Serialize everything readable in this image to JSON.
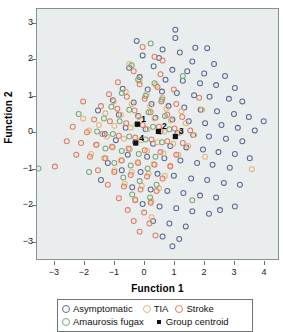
{
  "chart_data": {
    "type": "scatter",
    "title": "",
    "xlabel": "Function 1",
    "ylabel": "Function 2",
    "xlim": [
      -3.6,
      4.5
    ],
    "ylim": [
      -3.5,
      3.4
    ],
    "xticks": [
      -3,
      -2,
      -1,
      0,
      1,
      2,
      3,
      4
    ],
    "yticks": [
      -3,
      -2,
      -1,
      0,
      1,
      2,
      3
    ],
    "grid": false,
    "legend_position": "bottom",
    "marker": "open-circle",
    "series": [
      {
        "name": "Asymptomatic",
        "color": "#5a6b94",
        "points": [
          [
            1.05,
            2.83
          ],
          [
            1.05,
            2.6
          ],
          [
            1.72,
            2.33
          ],
          [
            2.12,
            2.32
          ],
          [
            0.62,
            2.28
          ],
          [
            1.2,
            2.2
          ],
          [
            -0.05,
            2.12
          ],
          [
            0.5,
            2.05
          ],
          [
            1.62,
            1.95
          ],
          [
            2.35,
            1.88
          ],
          [
            0.32,
            1.82
          ],
          [
            -0.5,
            1.78
          ],
          [
            0.95,
            1.72
          ],
          [
            1.45,
            1.68
          ],
          [
            2.02,
            1.62
          ],
          [
            2.72,
            1.55
          ],
          [
            -0.15,
            1.52
          ],
          [
            0.72,
            1.45
          ],
          [
            1.3,
            1.42
          ],
          [
            1.88,
            1.35
          ],
          [
            2.42,
            1.3
          ],
          [
            3.05,
            1.22
          ],
          [
            -0.72,
            1.2
          ],
          [
            0.12,
            1.18
          ],
          [
            0.6,
            1.12
          ],
          [
            1.1,
            1.08
          ],
          [
            1.68,
            1.02
          ],
          [
            2.2,
            0.98
          ],
          [
            2.85,
            0.92
          ],
          [
            3.3,
            0.85
          ],
          [
            -1.05,
            0.88
          ],
          [
            -0.35,
            0.82
          ],
          [
            0.25,
            0.78
          ],
          [
            0.82,
            0.72
          ],
          [
            1.35,
            0.68
          ],
          [
            1.9,
            0.62
          ],
          [
            2.45,
            0.58
          ],
          [
            3.02,
            0.5
          ],
          [
            3.52,
            0.42
          ],
          [
            -0.85,
            0.48
          ],
          [
            -0.2,
            0.45
          ],
          [
            0.38,
            0.4
          ],
          [
            0.95,
            0.35
          ],
          [
            1.5,
            0.3
          ],
          [
            2.05,
            0.25
          ],
          [
            2.6,
            0.2
          ],
          [
            3.15,
            0.12
          ],
          [
            3.72,
            0.05
          ],
          [
            4.02,
            0.3
          ],
          [
            -0.62,
            0.12
          ],
          [
            0.05,
            0.08
          ],
          [
            0.55,
            0.02
          ],
          [
            1.12,
            -0.02
          ],
          [
            1.65,
            -0.08
          ],
          [
            2.18,
            -0.12
          ],
          [
            2.75,
            -0.18
          ],
          [
            3.3,
            -0.25
          ],
          [
            -0.95,
            -0.22
          ],
          [
            -0.3,
            -0.28
          ],
          [
            0.3,
            -0.32
          ],
          [
            0.88,
            -0.38
          ],
          [
            1.42,
            -0.42
          ],
          [
            1.98,
            -0.48
          ],
          [
            2.5,
            -0.55
          ],
          [
            3.05,
            -0.6
          ],
          [
            3.55,
            -0.72
          ],
          [
            -0.55,
            -0.62
          ],
          [
            0.1,
            -0.68
          ],
          [
            0.68,
            -0.72
          ],
          [
            1.22,
            -0.78
          ],
          [
            1.78,
            -0.85
          ],
          [
            2.3,
            -0.9
          ],
          [
            2.88,
            -0.98
          ],
          [
            -1.22,
            -0.85
          ],
          [
            -0.75,
            -1.05
          ],
          [
            -0.12,
            -1.1
          ],
          [
            0.45,
            -1.15
          ],
          [
            1.0,
            -1.2
          ],
          [
            1.58,
            -1.28
          ],
          [
            2.12,
            -1.32
          ],
          [
            2.68,
            -1.4
          ],
          [
            3.22,
            -1.45
          ],
          [
            -0.4,
            -1.52
          ],
          [
            0.22,
            -1.58
          ],
          [
            0.78,
            -1.62
          ],
          [
            1.32,
            -1.68
          ],
          [
            1.88,
            -1.75
          ],
          [
            2.42,
            -1.8
          ],
          [
            -0.05,
            -1.98
          ],
          [
            0.52,
            -2.05
          ],
          [
            1.08,
            -2.1
          ],
          [
            1.62,
            -2.18
          ],
          [
            2.18,
            -2.25
          ],
          [
            0.3,
            -2.45
          ],
          [
            0.85,
            -2.52
          ],
          [
            1.4,
            -2.6
          ],
          [
            0.62,
            -2.88
          ],
          [
            1.18,
            -2.95
          ],
          [
            0.95,
            -3.15
          ],
          [
            -1.55,
            0.6
          ],
          [
            -1.32,
            -0.05
          ],
          [
            -1.45,
            -1.32
          ],
          [
            2.55,
            -2.15
          ],
          [
            3.05,
            -2.05
          ],
          [
            -0.25,
            2.52
          ]
        ]
      },
      {
        "name": "TIA",
        "color": "#e8b579",
        "points": [
          [
            -0.15,
            1.42
          ],
          [
            0.4,
            1.3
          ],
          [
            -0.62,
            1.12
          ],
          [
            0.08,
            1.05
          ],
          [
            0.62,
            0.95
          ],
          [
            -1.02,
            0.85
          ],
          [
            -0.42,
            0.78
          ],
          [
            0.2,
            0.72
          ],
          [
            0.75,
            0.65
          ],
          [
            1.25,
            0.58
          ],
          [
            -1.3,
            0.52
          ],
          [
            -0.78,
            0.48
          ],
          [
            -0.18,
            0.42
          ],
          [
            0.35,
            0.38
          ],
          [
            0.9,
            0.32
          ],
          [
            1.4,
            0.25
          ],
          [
            -1.52,
            0.2
          ],
          [
            -1.0,
            0.18
          ],
          [
            -0.45,
            0.12
          ],
          [
            0.12,
            0.08
          ],
          [
            0.68,
            0.02
          ],
          [
            1.18,
            -0.02
          ],
          [
            1.68,
            -0.08
          ],
          [
            -1.25,
            -0.12
          ],
          [
            -0.68,
            -0.18
          ],
          [
            -0.1,
            -0.22
          ],
          [
            0.45,
            -0.28
          ],
          [
            0.98,
            -0.32
          ],
          [
            1.48,
            -0.38
          ],
          [
            -1.62,
            -0.35
          ],
          [
            -1.05,
            -0.42
          ],
          [
            -0.48,
            -0.48
          ],
          [
            0.1,
            -0.52
          ],
          [
            0.65,
            -0.58
          ],
          [
            1.15,
            -0.62
          ],
          [
            -1.35,
            -0.72
          ],
          [
            -0.78,
            -0.78
          ],
          [
            -0.22,
            -0.82
          ],
          [
            0.32,
            -0.88
          ],
          [
            0.88,
            -0.92
          ],
          [
            -1.0,
            -1.05
          ],
          [
            -0.42,
            -1.1
          ],
          [
            0.15,
            -1.15
          ],
          [
            0.7,
            -1.2
          ],
          [
            -0.65,
            -1.42
          ],
          [
            -0.08,
            -1.48
          ],
          [
            0.5,
            -1.55
          ],
          [
            -0.3,
            -1.85
          ],
          [
            0.25,
            -1.9
          ],
          [
            -1.85,
            0.05
          ],
          [
            -1.78,
            -0.6
          ],
          [
            -2.05,
            0.38
          ],
          [
            2.05,
            -0.68
          ],
          [
            1.95,
            0.62
          ],
          [
            -0.5,
            1.88
          ],
          [
            0.25,
            -2.35
          ],
          [
            3.62,
            -1.02
          ]
        ]
      },
      {
        "name": "Stroke",
        "color": "#e07c62",
        "points": [
          [
            0.35,
            2.08
          ],
          [
            -0.35,
            1.68
          ],
          [
            0.55,
            1.6
          ],
          [
            -0.88,
            1.38
          ],
          [
            -0.15,
            1.32
          ],
          [
            0.45,
            1.25
          ],
          [
            1.0,
            1.18
          ],
          [
            -1.18,
            1.05
          ],
          [
            -0.58,
            0.98
          ],
          [
            0.02,
            0.92
          ],
          [
            0.58,
            0.85
          ],
          [
            1.08,
            0.78
          ],
          [
            -1.45,
            0.72
          ],
          [
            -0.9,
            0.65
          ],
          [
            -0.32,
            0.6
          ],
          [
            0.22,
            0.55
          ],
          [
            0.78,
            0.48
          ],
          [
            1.28,
            0.42
          ],
          [
            -1.68,
            0.35
          ],
          [
            -1.15,
            0.3
          ],
          [
            -0.6,
            0.25
          ],
          [
            -0.05,
            0.2
          ],
          [
            0.5,
            0.15
          ],
          [
            1.02,
            0.1
          ],
          [
            1.55,
            0.05
          ],
          [
            -1.92,
            0.0
          ],
          [
            -1.4,
            -0.05
          ],
          [
            -0.85,
            -0.1
          ],
          [
            -0.3,
            -0.15
          ],
          [
            0.25,
            -0.2
          ],
          [
            0.78,
            -0.25
          ],
          [
            1.3,
            -0.3
          ],
          [
            -2.12,
            -0.3
          ],
          [
            -1.6,
            -0.35
          ],
          [
            -1.08,
            -0.4
          ],
          [
            -0.52,
            -0.45
          ],
          [
            0.02,
            -0.5
          ],
          [
            0.55,
            -0.55
          ],
          [
            1.08,
            -0.62
          ],
          [
            -1.82,
            -0.68
          ],
          [
            -1.3,
            -0.72
          ],
          [
            -0.75,
            -0.78
          ],
          [
            -0.2,
            -0.85
          ],
          [
            0.35,
            -0.9
          ],
          [
            0.88,
            -0.95
          ],
          [
            -1.55,
            -1.05
          ],
          [
            -1.0,
            -1.1
          ],
          [
            -0.45,
            -1.18
          ],
          [
            0.1,
            -1.22
          ],
          [
            0.62,
            -1.28
          ],
          [
            -1.22,
            -1.45
          ],
          [
            -0.68,
            -1.5
          ],
          [
            -0.12,
            -1.58
          ],
          [
            0.42,
            -1.62
          ],
          [
            -0.85,
            -1.82
          ],
          [
            -0.3,
            -1.88
          ],
          [
            0.22,
            -1.95
          ],
          [
            -0.55,
            -2.15
          ],
          [
            0.0,
            -2.22
          ],
          [
            -0.35,
            -2.45
          ],
          [
            0.18,
            -2.52
          ],
          [
            -0.15,
            -2.75
          ],
          [
            0.38,
            -2.85
          ],
          [
            -2.4,
            0.15
          ],
          [
            -2.28,
            -0.62
          ],
          [
            -2.6,
            -0.25
          ],
          [
            0.62,
            1.98
          ],
          [
            -0.05,
            2.35
          ],
          [
            -3.0,
            -0.95
          ],
          [
            -2.05,
            0.85
          ],
          [
            1.85,
            0.95
          ]
        ]
      },
      {
        "name": "Amaurosis fugax",
        "color": "#7aa87a",
        "points": [
          [
            0.22,
            2.45
          ],
          [
            -0.42,
            1.85
          ],
          [
            -0.2,
            1.45
          ],
          [
            0.35,
            1.35
          ],
          [
            -0.75,
            1.08
          ],
          [
            0.05,
            1.0
          ],
          [
            0.6,
            0.9
          ],
          [
            -1.1,
            0.7
          ],
          [
            -0.5,
            0.62
          ],
          [
            0.15,
            0.55
          ],
          [
            0.7,
            0.45
          ],
          [
            -1.35,
            0.38
          ],
          [
            -0.82,
            0.3
          ],
          [
            -0.25,
            0.22
          ],
          [
            0.3,
            0.15
          ],
          [
            0.85,
            0.08
          ],
          [
            -1.58,
            0.02
          ],
          [
            -1.05,
            -0.05
          ],
          [
            -0.5,
            -0.12
          ],
          [
            0.05,
            -0.2
          ],
          [
            0.6,
            -0.28
          ],
          [
            -1.3,
            -0.45
          ],
          [
            -0.75,
            -0.52
          ],
          [
            -0.18,
            -0.6
          ],
          [
            0.38,
            -0.68
          ],
          [
            -1.0,
            -0.85
          ],
          [
            -0.45,
            -0.92
          ],
          [
            0.12,
            -1.0
          ],
          [
            -0.7,
            -1.25
          ],
          [
            -0.15,
            -1.35
          ],
          [
            0.42,
            -1.45
          ],
          [
            -0.4,
            -1.72
          ],
          [
            0.2,
            -1.8
          ],
          [
            -3.55,
            -1.0
          ],
          [
            1.62,
            -1.88
          ],
          [
            1.3,
            1.55
          ],
          [
            -1.85,
            -1.1
          ],
          [
            -2.2,
            0.5
          ]
        ]
      }
    ],
    "centroids": {
      "name": "Group centroid",
      "color": "#111111",
      "marker": "filled-square",
      "points": [
        {
          "label": "1",
          "x": -0.22,
          "y": 0.22
        },
        {
          "label": "2",
          "x": 0.48,
          "y": 0.02
        },
        {
          "label": "3",
          "x": 1.05,
          "y": -0.12
        },
        {
          "label": "4",
          "x": -0.28,
          "y": -0.3
        }
      ]
    }
  },
  "axes": {
    "x_title": "Function 1",
    "y_title": "Function 2",
    "x_tick_labels": [
      "−3",
      "−2",
      "−1",
      "0",
      "1",
      "2",
      "3",
      "4"
    ],
    "y_tick_labels": [
      "3",
      "2",
      "1",
      "0",
      "−1",
      "−2",
      "−3"
    ]
  },
  "legend": {
    "row1": [
      {
        "label": "Asymptomatic",
        "color": "#5a6b94",
        "shape": "circle"
      },
      {
        "label": "TIA",
        "color": "#e8b579",
        "shape": "circle"
      },
      {
        "label": "Stroke",
        "color": "#e07c62",
        "shape": "circle"
      }
    ],
    "row2": [
      {
        "label": "Amaurosis fugax",
        "color": "#7aa87a",
        "shape": "circle"
      },
      {
        "label": "Group centroid",
        "color": "#111111",
        "shape": "square"
      }
    ]
  }
}
